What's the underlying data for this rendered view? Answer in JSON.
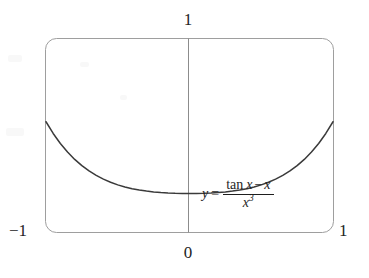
{
  "figure": {
    "name": "function-graph",
    "equation": {
      "lhs": "y",
      "equals": "=",
      "numerator_tan": "tan",
      "numerator_var1": "x",
      "numerator_minus": "−",
      "numerator_var2": "x",
      "denominator_base": "x",
      "denominator_exponent": "3",
      "plain_text": "y = (tan x − x) / x^3"
    },
    "labels": {
      "y_max": "1",
      "origin": "0",
      "x_min": "−1",
      "x_max": "1"
    },
    "colors": {
      "curve": "#3a3a3a",
      "frame": "#9a9a9a",
      "axis": "#8c8c8c",
      "text": "#242424",
      "background": "#ffffff"
    }
  },
  "chart_data": {
    "type": "line",
    "title": "",
    "subtitle": "",
    "xlabel": "",
    "ylabel": "",
    "xlim": [
      -1,
      1
    ],
    "ylim": [
      0,
      1
    ],
    "xticks": [
      -1,
      0,
      1
    ],
    "xticklabels": [
      "−1",
      "0",
      "1"
    ],
    "yticks": [
      1
    ],
    "yticklabels": [
      "1"
    ],
    "grid": false,
    "legend": false,
    "legend_position": "none",
    "annotations": [
      {
        "text": "y = (tan x − x) / x^3",
        "x": 0.42,
        "y": 0.3
      }
    ],
    "series": [
      {
        "name": "y = (tan x - x)/x^3",
        "x": [
          -1.0,
          -0.95,
          -0.9,
          -0.85,
          -0.8,
          -0.75,
          -0.7,
          -0.65,
          -0.6,
          -0.55,
          -0.5,
          -0.45,
          -0.4,
          -0.35,
          -0.3,
          -0.25,
          -0.2,
          -0.15,
          -0.1,
          -0.05,
          0.0,
          0.05,
          0.1,
          0.15,
          0.2,
          0.25,
          0.3,
          0.35,
          0.4,
          0.45,
          0.5,
          0.55,
          0.6,
          0.65,
          0.7,
          0.75,
          0.8,
          0.85,
          0.9,
          0.95,
          1.0
        ],
        "y": [
          0.5574,
          0.5263,
          0.4996,
          0.4767,
          0.4572,
          0.4406,
          0.4265,
          0.4146,
          0.4046,
          0.3963,
          0.3895,
          0.3839,
          0.3794,
          0.3758,
          0.3729,
          0.3707,
          0.369,
          0.3678,
          0.367,
          0.3667,
          0.3667,
          0.3667,
          0.367,
          0.3678,
          0.369,
          0.3707,
          0.3729,
          0.3758,
          0.3794,
          0.3839,
          0.3895,
          0.3963,
          0.4046,
          0.4146,
          0.4265,
          0.4406,
          0.4572,
          0.4767,
          0.4996,
          0.5263,
          0.5574
        ]
      }
    ]
  }
}
